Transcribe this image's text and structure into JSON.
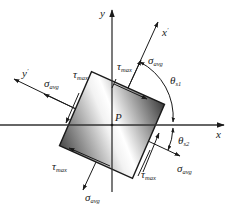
{
  "diagram": {
    "point_label": "P",
    "axes": {
      "x": "x",
      "y": "y",
      "x_prime": "x",
      "x_prime_mark": "′",
      "y_prime": "y",
      "y_prime_mark": "′"
    },
    "stress_labels": {
      "tau": "τ",
      "tau_sub": "max",
      "sigma": "σ",
      "sigma_sub": "avg"
    },
    "angles": {
      "theta": "θ",
      "theta_s1_sub": "s1",
      "theta_s2_sub": "s2"
    },
    "colors": {
      "line": "#1a1a1a",
      "shade_dark": "#4a4a4a",
      "shade_light": "#ffffff",
      "axis": "#333333"
    }
  }
}
